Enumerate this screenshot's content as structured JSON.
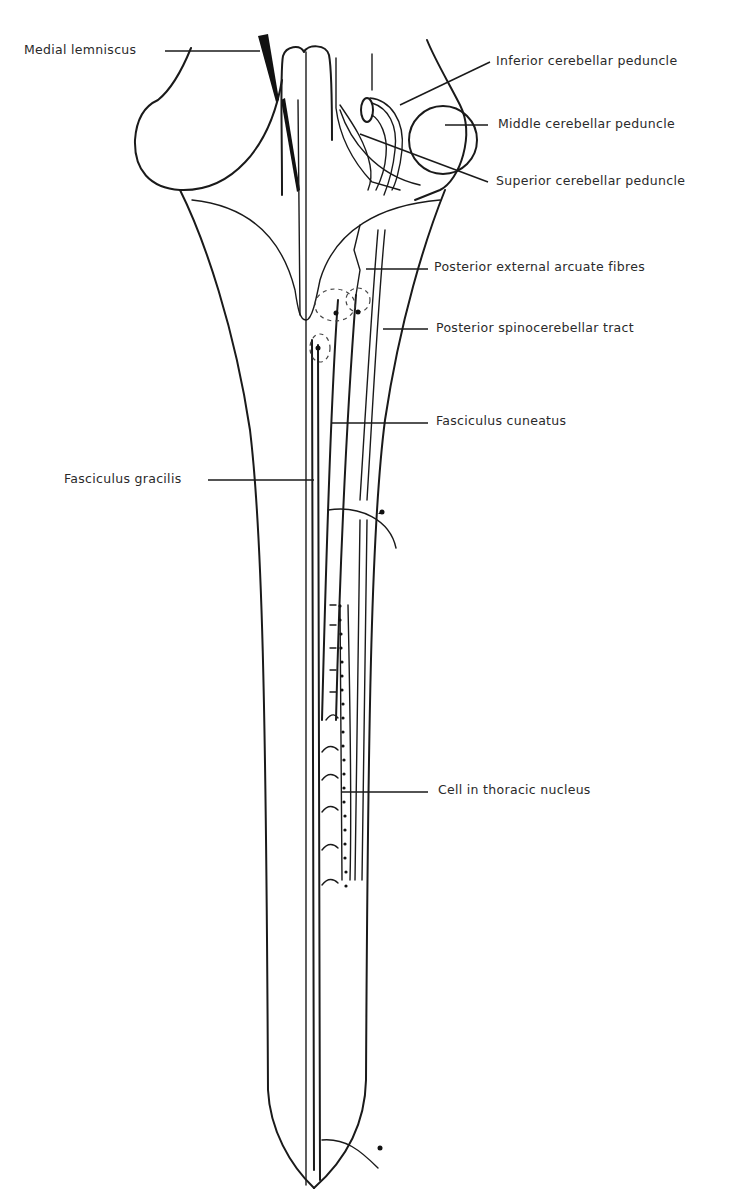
{
  "diagram": {
    "labels": {
      "medial_lemniscus": "Medial lemniscus",
      "inferior_cerebellar_peduncle": "Inferior cerebellar peduncle",
      "middle_cerebellar_peduncle": "Middle cerebellar peduncle",
      "superior_cerebellar_peduncle": "Superior cerebellar peduncle",
      "posterior_external_arcuate_fibres": "Posterior external arcuate fibres",
      "posterior_spinocerebellar_tract": "Posterior spinocerebellar tract",
      "fasciculus_cuneatus": "Fasciculus cuneatus",
      "fasciculus_gracilis": "Fasciculus gracilis",
      "cell_in_thoracic_nucleus": "Cell in thoracic nucleus"
    },
    "colors": {
      "ink": "#1a1a1a",
      "text": "#2a2a2a",
      "background": "#ffffff"
    }
  }
}
